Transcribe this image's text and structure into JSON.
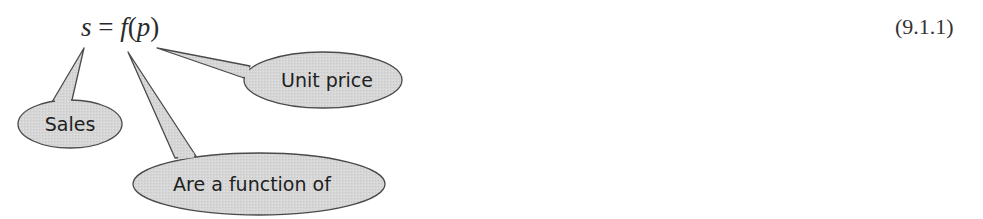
{
  "equation": {
    "lhs": "s",
    "equals": "=",
    "func": "f",
    "open_paren": "(",
    "arg": "p",
    "close_paren": ")",
    "number": "(9.1.1)"
  },
  "callouts": [
    {
      "id": "sales",
      "label": "Sales",
      "points_to": "s"
    },
    {
      "id": "unit-price",
      "label": "Unit price",
      "points_to": "p"
    },
    {
      "id": "function-of",
      "label": "Are a function of",
      "points_to": "f"
    }
  ],
  "colors": {
    "bubble_fill": "#d9d9d9",
    "bubble_stroke": "#4a4a4a",
    "text": "#1e1e1e"
  }
}
